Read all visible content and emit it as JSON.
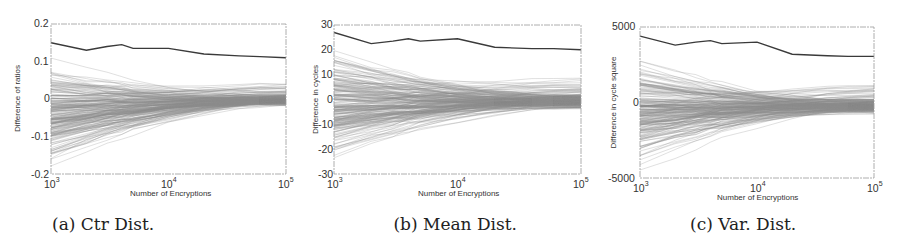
{
  "chart_data": [
    {
      "type": "line",
      "id": "ctr",
      "caption": "(a) Ctr Dist.",
      "title": "",
      "xlabel": "Number of Encryptions",
      "ylabel": "Difference of ratios",
      "xscale": "log",
      "xlim": [
        1000,
        100000
      ],
      "ylim": [
        -0.2,
        0.2
      ],
      "xticks": [
        {
          "base": "10",
          "exp": "3"
        },
        {
          "base": "10",
          "exp": "4"
        },
        {
          "base": "10",
          "exp": "5"
        }
      ],
      "yticks": [
        "0.2",
        "0.1",
        "0",
        "-0.1",
        "-0.2"
      ],
      "ytick_values": [
        0.2,
        0.1,
        0,
        -0.1,
        -0.2
      ],
      "grid": false,
      "x": [
        1000,
        2000,
        3000,
        4000,
        5000,
        10000,
        20000,
        40000,
        60000,
        100000
      ],
      "series": [
        {
          "name": "max difference (dark line)",
          "values": [
            0.15,
            0.13,
            0.14,
            0.145,
            0.135,
            0.135,
            0.12,
            0.115,
            0.113,
            0.11
          ]
        },
        {
          "name": "key-guess traces (light gray, many)",
          "start_range": [
            -0.2,
            0.12
          ],
          "end_range": [
            -0.02,
            0.05
          ],
          "count": 200
        }
      ]
    },
    {
      "type": "line",
      "id": "mean",
      "caption": "(b) Mean Dist.",
      "title": "",
      "xlabel": "Number of Encryptions",
      "ylabel": "Difference in cycles",
      "xscale": "log",
      "xlim": [
        1000,
        100000
      ],
      "ylim": [
        -30,
        30
      ],
      "xticks": [
        {
          "base": "10",
          "exp": "3"
        },
        {
          "base": "10",
          "exp": "4"
        },
        {
          "base": "10",
          "exp": "5"
        }
      ],
      "yticks": [
        "30",
        "20",
        "10",
        "0",
        "-10",
        "-20",
        "-30"
      ],
      "ytick_values": [
        30,
        20,
        10,
        0,
        -10,
        -20,
        -30
      ],
      "grid": false,
      "x": [
        1000,
        2000,
        3000,
        4000,
        5000,
        10000,
        20000,
        40000,
        60000,
        100000
      ],
      "series": [
        {
          "name": "max difference (dark line)",
          "values": [
            27,
            22.5,
            23.5,
            24.5,
            23.5,
            24.5,
            21,
            20.5,
            20.5,
            20
          ]
        },
        {
          "name": "key-guess traces (light gray, many)",
          "start_range": [
            -30,
            25
          ],
          "end_range": [
            -4,
            10
          ],
          "count": 200
        }
      ]
    },
    {
      "type": "line",
      "id": "var",
      "caption": "(c) Var. Dist.",
      "title": "",
      "xlabel": "Number of Encryptions",
      "ylabel": "Difference in cycle square",
      "xscale": "log",
      "xlim": [
        1000,
        100000
      ],
      "ylim": [
        -5000,
        5000
      ],
      "xticks": [
        {
          "base": "10",
          "exp": "3"
        },
        {
          "base": "10",
          "exp": "4"
        },
        {
          "base": "10",
          "exp": "5"
        }
      ],
      "yticks": [
        "5000",
        "0",
        "-5000"
      ],
      "ytick_values": [
        5000,
        0,
        -5000
      ],
      "grid": false,
      "x": [
        1000,
        2000,
        3000,
        4000,
        5000,
        10000,
        20000,
        40000,
        60000,
        100000
      ],
      "series": [
        {
          "name": "max difference (dark line)",
          "values": [
            4400,
            3800,
            4000,
            4100,
            3900,
            4000,
            3200,
            3100,
            3050,
            3050
          ]
        },
        {
          "name": "key-guess traces (light gray, many)",
          "start_range": [
            -5000,
            3800
          ],
          "end_range": [
            -800,
            1700
          ],
          "count": 200
        }
      ]
    }
  ],
  "layout": {
    "panels": [
      {
        "left": 0,
        "frame": [
          51,
          24,
          286,
          174
        ],
        "caption_x": 52
      },
      {
        "left": 300,
        "frame": [
          334,
          25,
          581,
          174
        ],
        "caption_x": 217
      },
      {
        "left": 600,
        "frame": [
          640,
          27,
          874,
          178
        ],
        "caption_x": 390
      }
    ],
    "colors": {
      "max_line": "#3a3a3a",
      "trace": "#8a8a8a",
      "frame": "#9a9a9a",
      "text": "#333333"
    }
  }
}
